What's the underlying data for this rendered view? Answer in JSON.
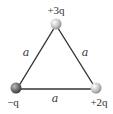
{
  "diagram": {
    "type": "equilateral-triangle-charges",
    "side_label": "a",
    "charges": [
      {
        "position": "top",
        "label": "+3q",
        "sign": "+",
        "magnitude": "3q"
      },
      {
        "position": "bottom-left",
        "label": "−q",
        "sign": "−",
        "magnitude": "q"
      },
      {
        "position": "bottom-right",
        "label": "+2q",
        "sign": "+",
        "magnitude": "2q"
      }
    ],
    "sides": [
      {
        "between": "top–bottom-left",
        "label": "a"
      },
      {
        "between": "top–bottom-right",
        "label": "a"
      },
      {
        "between": "bottom-left–bottom-right",
        "label": "a"
      }
    ],
    "colors": {
      "edge": "#333333",
      "negative_sphere": "#777777",
      "positive_sphere": "#c8c8c8"
    }
  }
}
